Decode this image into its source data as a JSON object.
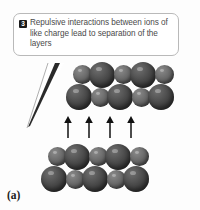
{
  "figure": {
    "panel_label": "(a)",
    "background_color": "#fdfdfd"
  },
  "callout": {
    "badge_number": "3",
    "text": "Repulsive interactions between ions of like charge lead to separation of the layers",
    "border_color": "#b9b9b9",
    "text_color": "#4a4a4a",
    "badge_background": "#1b1b1b",
    "badge_text_color": "#ffffff",
    "pointer": "tapered-wedge-down-left"
  },
  "diagram": {
    "type": "ionic-crystal-layer-separation",
    "arrow_count": 4,
    "arrow_direction": "up",
    "arrow_color": "#111111",
    "sphere_large_color": "#4d4d4d",
    "sphere_small_color": "#6a6a6a",
    "layers": [
      {
        "name": "upper-layer",
        "rows": [
          {
            "name": "upper-back-row",
            "spheres": [
              "small",
              "large",
              "small",
              "large",
              "small"
            ]
          },
          {
            "name": "upper-front-row",
            "spheres": [
              "large",
              "small",
              "large",
              "small",
              "large"
            ]
          }
        ]
      },
      {
        "name": "lower-layer",
        "rows": [
          {
            "name": "lower-back-row",
            "spheres": [
              "small",
              "large",
              "small",
              "large",
              "small"
            ]
          },
          {
            "name": "lower-front-row",
            "spheres": [
              "large",
              "small",
              "large",
              "small",
              "large"
            ]
          }
        ]
      }
    ]
  }
}
